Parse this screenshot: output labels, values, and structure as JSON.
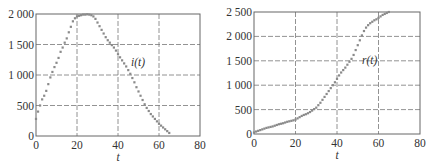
{
  "chart_data": [
    {
      "type": "scatter",
      "title": "",
      "xlabel": "t",
      "ylabel": "",
      "series_label": "i(t)",
      "xlim": [
        0,
        80
      ],
      "ylim": [
        0,
        2000
      ],
      "xticks": [
        0,
        20,
        40,
        60,
        80
      ],
      "xtick_labels": [
        "0",
        "20",
        "40",
        "60",
        "80"
      ],
      "yticks": [
        0,
        500,
        1000,
        1500,
        2000
      ],
      "ytick_labels": [
        "0",
        "500",
        "1 000",
        "1 500",
        "2 000"
      ],
      "grid": true,
      "marker_color": "#8a8a8a",
      "x": [
        0,
        1,
        2,
        3,
        4,
        5,
        6,
        7,
        8,
        9,
        10,
        11,
        12,
        13,
        14,
        15,
        16,
        17,
        18,
        19,
        20,
        21,
        22,
        23,
        24,
        25,
        26,
        27,
        28,
        29,
        30,
        31,
        32,
        33,
        34,
        35,
        36,
        37,
        38,
        39,
        40,
        41,
        42,
        43,
        44,
        45,
        46,
        47,
        48,
        49,
        50,
        51,
        52,
        53,
        54,
        55,
        56,
        57,
        58,
        59,
        60,
        61,
        62,
        63,
        64,
        65
      ],
      "values": [
        280,
        400,
        500,
        600,
        660,
        740,
        850,
        960,
        1050,
        1130,
        1200,
        1280,
        1380,
        1450,
        1530,
        1600,
        1700,
        1790,
        1880,
        1930,
        1960,
        1970,
        1980,
        1990,
        1990,
        1995,
        1990,
        1980,
        1960,
        1920,
        1860,
        1800,
        1740,
        1680,
        1620,
        1570,
        1530,
        1490,
        1450,
        1400,
        1340,
        1290,
        1240,
        1190,
        1140,
        1080,
        1020,
        950,
        880,
        800,
        730,
        660,
        590,
        520,
        460,
        410,
        360,
        320,
        280,
        240,
        200,
        170,
        140,
        110,
        80,
        50
      ]
    },
    {
      "type": "scatter",
      "title": "",
      "xlabel": "t",
      "ylabel": "",
      "series_label": "r(t)",
      "xlim": [
        0,
        80
      ],
      "ylim": [
        0,
        2500
      ],
      "xticks": [
        0,
        20,
        40,
        60,
        80
      ],
      "xtick_labels": [
        "0",
        "20",
        "40",
        "60",
        "80"
      ],
      "yticks": [
        0,
        500,
        1000,
        1500,
        2000,
        2500
      ],
      "ytick_labels": [
        "0",
        "500",
        "1 000",
        "1 500",
        "2 000",
        "2 500"
      ],
      "grid": true,
      "marker_color": "#8a8a8a",
      "x": [
        0,
        1,
        2,
        3,
        4,
        5,
        6,
        7,
        8,
        9,
        10,
        11,
        12,
        13,
        14,
        15,
        16,
        17,
        18,
        19,
        20,
        21,
        22,
        23,
        24,
        25,
        26,
        27,
        28,
        29,
        30,
        31,
        32,
        33,
        34,
        35,
        36,
        37,
        38,
        39,
        40,
        41,
        42,
        43,
        44,
        45,
        46,
        47,
        48,
        49,
        50,
        51,
        52,
        53,
        54,
        55,
        56,
        57,
        58,
        59,
        60,
        61,
        62,
        63,
        64,
        65
      ],
      "values": [
        30,
        50,
        65,
        80,
        95,
        110,
        125,
        135,
        145,
        155,
        170,
        185,
        200,
        210,
        220,
        235,
        250,
        260,
        270,
        280,
        295,
        320,
        345,
        370,
        390,
        405,
        425,
        450,
        480,
        510,
        540,
        590,
        640,
        700,
        760,
        820,
        880,
        940,
        1000,
        1060,
        1130,
        1200,
        1260,
        1310,
        1360,
        1420,
        1480,
        1540,
        1620,
        1720,
        1820,
        1920,
        2020,
        2110,
        2180,
        2230,
        2270,
        2300,
        2330,
        2350,
        2380,
        2410,
        2440,
        2460,
        2480,
        2500
      ]
    }
  ]
}
